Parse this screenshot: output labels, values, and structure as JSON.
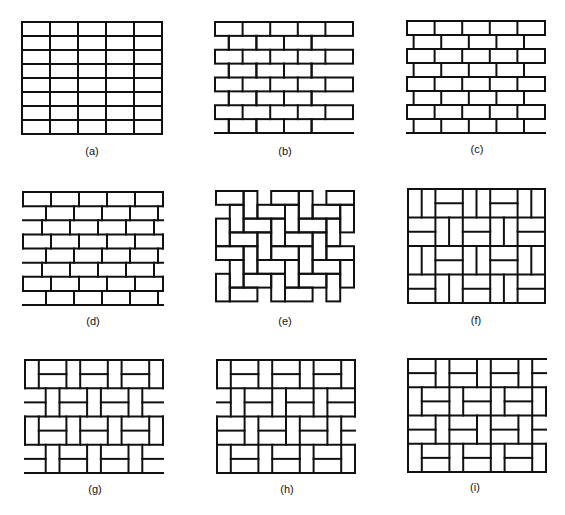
{
  "figure": {
    "stroke_color": "#111111",
    "background": "#ffffff",
    "panels": [
      {
        "id": "a",
        "label": "(a)",
        "pattern": "stack-bond",
        "box": [
          22,
          22,
          140,
          112
        ],
        "label_pos": [
          92,
          152
        ]
      },
      {
        "id": "b",
        "label": "(b)",
        "pattern": "running-bond",
        "box": [
          215,
          22,
          138,
          111
        ],
        "label_pos": [
          285,
          152
        ]
      },
      {
        "id": "c",
        "label": "(c)",
        "pattern": "quarter-running-bond",
        "box": [
          407,
          21,
          138,
          112
        ],
        "label_pos": [
          477,
          150
        ]
      },
      {
        "id": "d",
        "label": "(d)",
        "pattern": "raking-stretcher-bond",
        "box": [
          23,
          192,
          140,
          113
        ],
        "label_pos": [
          93,
          322
        ]
      },
      {
        "id": "e",
        "label": "(e)",
        "pattern": "herringbone",
        "box": [
          216,
          191,
          138,
          110
        ],
        "label_pos": [
          285,
          322
        ]
      },
      {
        "id": "f",
        "label": "(f)",
        "pattern": "basket-weave",
        "box": [
          408,
          189,
          137,
          114
        ],
        "label_pos": [
          476,
          321
        ]
      },
      {
        "id": "g",
        "label": "(g)",
        "pattern": "basket-stack-half",
        "box": [
          25,
          360,
          138,
          113
        ],
        "label_pos": [
          95,
          490
        ]
      },
      {
        "id": "h",
        "label": "(h)",
        "pattern": "basket-diagonal-right",
        "box": [
          217,
          360,
          138,
          113
        ],
        "label_pos": [
          287,
          490
        ]
      },
      {
        "id": "i",
        "label": "(i)",
        "pattern": "basket-alternating",
        "box": [
          408,
          359,
          138,
          113
        ],
        "label_pos": [
          475,
          488
        ]
      }
    ]
  }
}
